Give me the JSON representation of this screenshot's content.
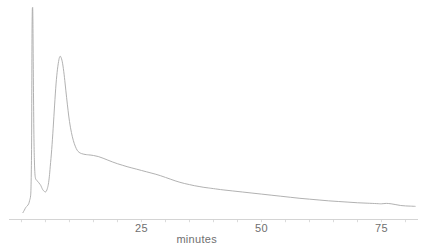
{
  "chart_data": {
    "type": "line",
    "title": "",
    "xlabel": "minutes",
    "ylabel": "",
    "grid": false,
    "legend": null,
    "xlim": [
      -2.6,
      82.6
    ],
    "ylim": [
      0,
      1.0
    ],
    "xticks": [
      0,
      5,
      10,
      15,
      20,
      25,
      30,
      35,
      40,
      45,
      50,
      55,
      60,
      65,
      70,
      75,
      80
    ],
    "xtick_labels": [
      "",
      "",
      "",
      "",
      "",
      "25",
      "",
      "",
      "",
      "",
      "50",
      "",
      "",
      "",
      "",
      "75",
      ""
    ],
    "labeled_ticks": [
      {
        "value": 25,
        "label": "25"
      },
      {
        "value": 50,
        "label": "50"
      },
      {
        "value": 75,
        "label": "75"
      }
    ],
    "yticks": [],
    "ytick_labels": [],
    "series": [
      {
        "name": "detector-signal",
        "color": "#a8a8a8",
        "points": [
          [
            0.3,
            0.03
          ],
          [
            0.6,
            0.042
          ],
          [
            0.9,
            0.055
          ],
          [
            1.2,
            0.062
          ],
          [
            1.5,
            0.072
          ],
          [
            1.7,
            0.088
          ],
          [
            1.9,
            0.11
          ],
          [
            2.0,
            0.165
          ],
          [
            2.1,
            0.33
          ],
          [
            2.15,
            0.62
          ],
          [
            2.2,
            0.88
          ],
          [
            2.25,
            0.985
          ],
          [
            2.3,
            1.0
          ],
          [
            2.35,
            0.99
          ],
          [
            2.4,
            0.88
          ],
          [
            2.5,
            0.6
          ],
          [
            2.6,
            0.38
          ],
          [
            2.7,
            0.27
          ],
          [
            2.8,
            0.215
          ],
          [
            2.9,
            0.195
          ],
          [
            3.0,
            0.188
          ],
          [
            3.2,
            0.182
          ],
          [
            3.4,
            0.178
          ],
          [
            3.6,
            0.172
          ],
          [
            3.8,
            0.166
          ],
          [
            4.0,
            0.16
          ],
          [
            4.2,
            0.15
          ],
          [
            4.4,
            0.14
          ],
          [
            4.6,
            0.134
          ],
          [
            4.8,
            0.13
          ],
          [
            5.0,
            0.128
          ],
          [
            5.2,
            0.133
          ],
          [
            5.4,
            0.145
          ],
          [
            5.6,
            0.165
          ],
          [
            5.8,
            0.2
          ],
          [
            6.0,
            0.25
          ],
          [
            6.3,
            0.33
          ],
          [
            6.6,
            0.43
          ],
          [
            6.9,
            0.54
          ],
          [
            7.2,
            0.64
          ],
          [
            7.5,
            0.71
          ],
          [
            7.8,
            0.755
          ],
          [
            8.0,
            0.77
          ],
          [
            8.2,
            0.768
          ],
          [
            8.5,
            0.745
          ],
          [
            8.8,
            0.7
          ],
          [
            9.1,
            0.64
          ],
          [
            9.4,
            0.575
          ],
          [
            9.7,
            0.515
          ],
          [
            10.0,
            0.462
          ],
          [
            10.4,
            0.41
          ],
          [
            10.8,
            0.372
          ],
          [
            11.2,
            0.345
          ],
          [
            11.6,
            0.326
          ],
          [
            12.0,
            0.316
          ],
          [
            12.5,
            0.31
          ],
          [
            13.0,
            0.307
          ],
          [
            13.5,
            0.305
          ],
          [
            14.0,
            0.304
          ],
          [
            15.0,
            0.301
          ],
          [
            16.0,
            0.296
          ],
          [
            17.0,
            0.288
          ],
          [
            18.0,
            0.279
          ],
          [
            19.0,
            0.27
          ],
          [
            20.0,
            0.262
          ],
          [
            21.0,
            0.255
          ],
          [
            22.0,
            0.248
          ],
          [
            23.0,
            0.242
          ],
          [
            24.0,
            0.236
          ],
          [
            25.0,
            0.23
          ],
          [
            26.0,
            0.224
          ],
          [
            27.0,
            0.218
          ],
          [
            28.0,
            0.212
          ],
          [
            29.0,
            0.205
          ],
          [
            30.0,
            0.197
          ],
          [
            31.0,
            0.189
          ],
          [
            32.0,
            0.181
          ],
          [
            33.0,
            0.174
          ],
          [
            34.0,
            0.168
          ],
          [
            35.0,
            0.163
          ],
          [
            36.0,
            0.158
          ],
          [
            37.0,
            0.154
          ],
          [
            38.0,
            0.15
          ],
          [
            39.0,
            0.147
          ],
          [
            40.0,
            0.144
          ],
          [
            42.0,
            0.138
          ],
          [
            44.0,
            0.133
          ],
          [
            46.0,
            0.128
          ],
          [
            48.0,
            0.123
          ],
          [
            50.0,
            0.118
          ],
          [
            52.0,
            0.113
          ],
          [
            54.0,
            0.108
          ],
          [
            56.0,
            0.103
          ],
          [
            58.0,
            0.098
          ],
          [
            60.0,
            0.094
          ],
          [
            62.0,
            0.09
          ],
          [
            64.0,
            0.086
          ],
          [
            66.0,
            0.083
          ],
          [
            68.0,
            0.08
          ],
          [
            70.0,
            0.077
          ],
          [
            72.0,
            0.075
          ],
          [
            74.0,
            0.073
          ],
          [
            75.0,
            0.072
          ],
          [
            76.0,
            0.074
          ],
          [
            77.0,
            0.072
          ],
          [
            78.0,
            0.068
          ],
          [
            79.0,
            0.064
          ],
          [
            80.0,
            0.062
          ],
          [
            81.0,
            0.061
          ],
          [
            82.0,
            0.06
          ]
        ]
      }
    ],
    "annotations": []
  },
  "axis": {
    "x_title": "minutes",
    "labels": [
      "25",
      "50",
      "75"
    ],
    "line_color": "#c9c9c9",
    "tick_color": "#d2d2d2",
    "text_color": "#6f6f6f"
  },
  "trace": {
    "color": "#a8a8a8",
    "width": "0.9"
  },
  "canvas": {
    "background": "#ffffff"
  }
}
